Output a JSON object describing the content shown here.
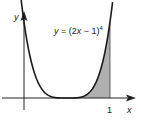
{
  "chart_data": {
    "type": "line",
    "title": "",
    "function_label": "y = (2x − 1)⁴",
    "equation": "y = (2x - 1)^4",
    "xlabel": "x",
    "ylabel": "y",
    "x_ticks": [
      {
        "value": 1,
        "label": "1"
      }
    ],
    "shaded_region": {
      "from": 0.5,
      "to": 1,
      "under": "curve",
      "color": "#b0b0b0"
    },
    "x": [
      -0.05,
      0.0,
      0.1,
      0.2,
      0.3,
      0.4,
      0.5,
      0.6,
      0.7,
      0.8,
      0.9,
      1.0,
      1.03
    ],
    "y": [
      1.4641,
      1.0,
      0.4096,
      0.1296,
      0.0256,
      0.0016,
      0.0,
      0.0016,
      0.0256,
      0.1296,
      0.4096,
      1.0,
      1.1475
    ],
    "grid": false,
    "legend": null
  },
  "labels": {
    "y_axis": "y",
    "x_axis": "x",
    "tick_one": "1",
    "func_prefix": "y = (2",
    "func_x": "x",
    "func_suffix": " − 1)",
    "func_exp": "4"
  },
  "colors": {
    "curve": "#1a1a1a",
    "axes": "#222222",
    "shade": "#b3b3b3"
  }
}
